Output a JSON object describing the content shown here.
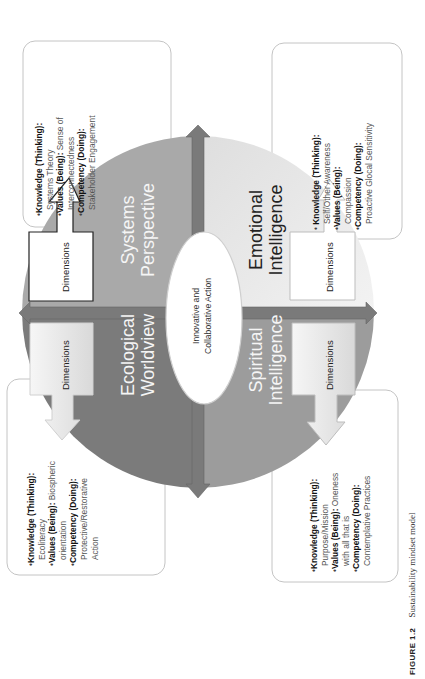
{
  "figure": {
    "label": "FIGURE 1.2",
    "caption": "Sustainability mindset model"
  },
  "center": {
    "line1": "Innovative and",
    "line2": "Collaborative Action"
  },
  "quadrants": {
    "systems": {
      "title_line1": "Systems",
      "title_line2": "Perspective",
      "dimensions_label": "Dimensions",
      "fill": "#a9a9a9",
      "items": [
        {
          "key": "Knowledge (Thinking)",
          "sep": ":",
          "value": "",
          "cont": "Systems Theory"
        },
        {
          "key": "Values (Being)",
          "sep": ":",
          "value": " Sense of",
          "cont": "Interconnectedness"
        },
        {
          "key": "Competency (Doing)",
          "sep": ":",
          "value": "",
          "cont": "Stakeholder Engagement"
        }
      ]
    },
    "emotional": {
      "title_line1": "Emotional",
      "title_line2": "Intelligence",
      "dimensions_label": "Dimensions",
      "fill": "#e9e9e9",
      "items": [
        {
          "key": "Knowledge (Thinking)",
          "sep": ":",
          "value": "",
          "cont": "Self/Other Awareness"
        },
        {
          "key": "Values (Being)",
          "sep": ":",
          "value": "",
          "cont": "Compassion"
        },
        {
          "key": "Competency (Doing)",
          "sep": ":",
          "value": "",
          "cont": "Proactive Glocal Sensitivity"
        }
      ]
    },
    "ecological": {
      "title_line1": "Ecological",
      "title_line2": "Worldview",
      "dimensions_label": "Dimensions",
      "fill": "#7b7b7b",
      "items": [
        {
          "key": "Knowledge (Thinking)",
          "sep": ":",
          "value": "",
          "cont": "Ecoliteracy"
        },
        {
          "key": "Values (Being)",
          "sep": ":",
          "value": " Biospheric",
          "cont": "orientation"
        },
        {
          "key": "Competency (Doing)",
          "sep": ":",
          "value": "",
          "cont": "Protective/Restorative",
          "cont2": "Action"
        }
      ]
    },
    "spiritual": {
      "title_line1": "Spiritual",
      "title_line2": "Intelligence",
      "dimensions_label": "Dimensions",
      "fill": "#9c9c9c",
      "items": [
        {
          "key": "Knowledge (Thinking)",
          "sep": ":",
          "value": "",
          "cont": "Purpose/Mission"
        },
        {
          "key": "Values (Being)",
          "sep": ":",
          "value": " Oneness",
          "cont": "with all that is"
        },
        {
          "key": "Competency (Doing)",
          "sep": ":",
          "value": "",
          "cont": "Contemplative Practices"
        }
      ]
    }
  },
  "colors": {
    "axis_arrow": "#777777",
    "box_border": "#bdbdbd",
    "ellipse_fill": "#ffffff"
  }
}
